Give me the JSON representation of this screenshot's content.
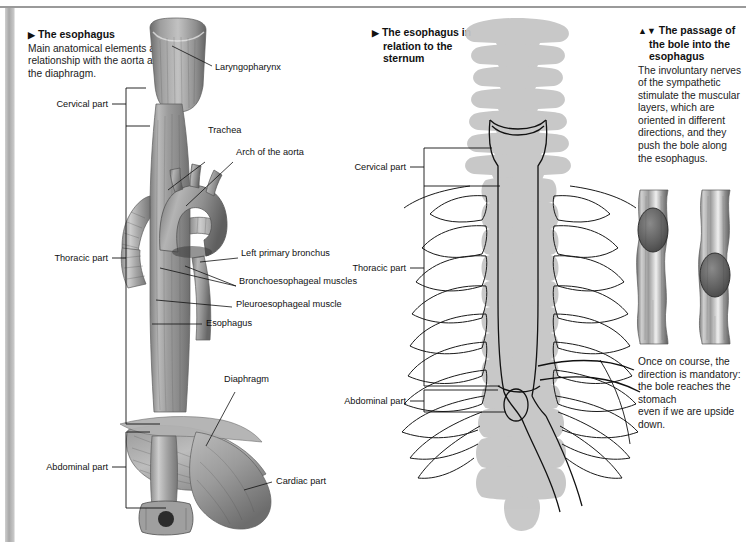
{
  "page": {
    "bg_color": "#ffffff",
    "rule_color": "#9a9a9a",
    "ink_color": "#111111"
  },
  "panel_left": {
    "marker": "▶",
    "title": "The esophagus",
    "body": "Main anatomical elements and relationship with the aorta and the diaphragm.",
    "bracket_labels": [
      {
        "name": "cervical",
        "label": "Cervical part"
      },
      {
        "name": "thoracic",
        "label": "Thoracic part"
      },
      {
        "name": "abdominal",
        "label": "Abdominal part"
      }
    ],
    "callouts": [
      {
        "name": "laryngopharynx",
        "label": "Laryngopharynx"
      },
      {
        "name": "trachea",
        "label": "Trachea"
      },
      {
        "name": "arch-of-the-aorta",
        "label": "Arch of the aorta"
      },
      {
        "name": "left-primary-bronchus",
        "label": "Left primary bronchus"
      },
      {
        "name": "bronchoesophageal-muscles",
        "label": "Bronchoesophageal muscles"
      },
      {
        "name": "pleuroesophageal-muscle",
        "label": "Pleuroesophageal muscle"
      },
      {
        "name": "esophagus",
        "label": "Esophagus"
      },
      {
        "name": "diaphragm",
        "label": "Diaphragm"
      },
      {
        "name": "cardiac-part",
        "label": "Cardiac part"
      }
    ]
  },
  "panel_middle": {
    "marker": "▶",
    "title_line1": "The esophagus in",
    "title_line2": "relation to the",
    "title_line3": "sternum",
    "bracket_labels": [
      {
        "name": "cervical",
        "label": "Cervical part"
      },
      {
        "name": "thoracic",
        "label": "Thoracic part"
      },
      {
        "name": "abdominal",
        "label": "Abdominal part"
      }
    ]
  },
  "panel_right": {
    "marker": "▲▼",
    "title_line1": "The passage of",
    "title_line2": "the bole into the",
    "title_line3": "esophagus",
    "body": "The involuntary nerves of the sympathetic stimulate the muscular layers, which are oriented in different directions, and they push the bole along the esophagus.",
    "caption_line1": "Once on course, the direction is mandatory: the bole reaches the stomach",
    "caption_line2": "even if we are upside down."
  }
}
